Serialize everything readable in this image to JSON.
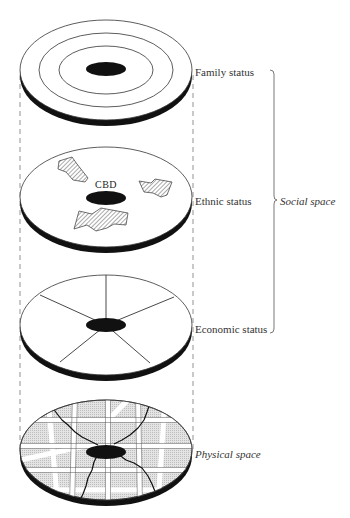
{
  "diagram": {
    "type": "layered model of urban social and physical space",
    "layers": [
      {
        "id": "family",
        "label": "Family status",
        "pattern": "concentric rings around central core"
      },
      {
        "id": "ethnic",
        "label": "Ethnic status",
        "pattern": "scattered hatched clusters",
        "center_label": "CBD"
      },
      {
        "id": "economic",
        "label": "Economic status",
        "pattern": "radial sectors around central core"
      },
      {
        "id": "physical",
        "label": "Physical space",
        "pattern": "street grid with central core"
      }
    ],
    "bracket": {
      "label": "Social space",
      "spans": [
        "Family status",
        "Ethnic status",
        "Economic status"
      ]
    }
  },
  "colors": {
    "ink": "#111111",
    "line": "#444444",
    "disk_fill": "#ffffff",
    "block_fill": "#d9d9d9",
    "road": "#ffffff",
    "dashed": "#777777"
  }
}
